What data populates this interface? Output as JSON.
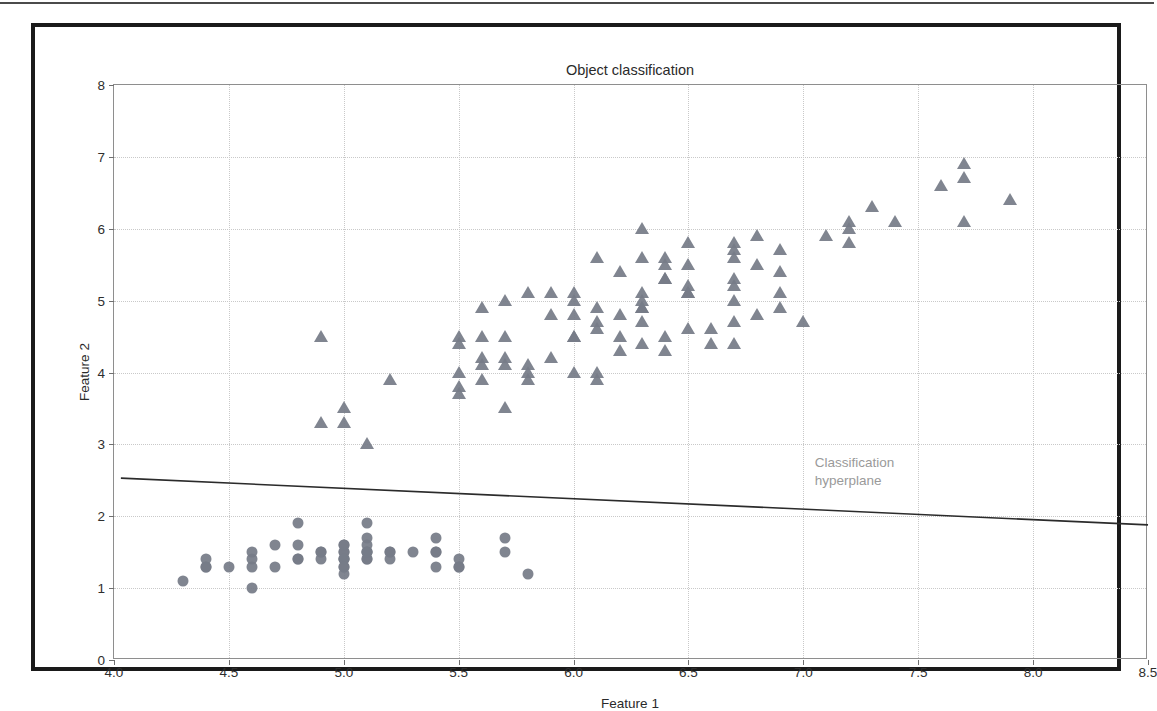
{
  "chart_data": {
    "type": "scatter",
    "title": "Object classification",
    "xlabel": "Feature 1",
    "ylabel": "Feature 2",
    "xlim": [
      4.0,
      8.5
    ],
    "ylim": [
      0,
      8
    ],
    "xticks": [
      "4.0",
      "4.5",
      "5.0",
      "5.5",
      "6.0",
      "6.5",
      "7.0",
      "7.5",
      "8.0",
      "8.5"
    ],
    "xtick_values": [
      4.0,
      4.5,
      5.0,
      5.5,
      6.0,
      6.5,
      7.0,
      7.5,
      8.0,
      8.5
    ],
    "yticks": [
      "0",
      "1",
      "2",
      "3",
      "4",
      "5",
      "6",
      "7",
      "8"
    ],
    "ytick_values": [
      0,
      1,
      2,
      3,
      4,
      5,
      6,
      7,
      8
    ],
    "grid": true,
    "grid_style": "dotted",
    "legend": "none",
    "marker_color": "#767c88",
    "line_color": "#2b2b2b",
    "annotation_color": "#9a9a9a",
    "annotations": [
      {
        "name": "hyperplane-label",
        "line1": "Classification",
        "line2": "hyperplane",
        "x": 7.05,
        "y": 2.62
      }
    ],
    "hyperplane": {
      "label": "Classification hyperplane",
      "x0": 4.03,
      "y0": 2.53,
      "x1": 8.5,
      "y1": 1.88
    },
    "series": [
      {
        "name": "class-a",
        "marker": "circle",
        "points": [
          [
            4.3,
            1.1
          ],
          [
            4.4,
            1.3
          ],
          [
            4.4,
            1.4
          ],
          [
            4.4,
            1.3
          ],
          [
            4.5,
            1.3
          ],
          [
            4.6,
            1.0
          ],
          [
            4.6,
            1.4
          ],
          [
            4.6,
            1.5
          ],
          [
            4.6,
            1.3
          ],
          [
            4.7,
            1.3
          ],
          [
            4.7,
            1.6
          ],
          [
            4.8,
            1.4
          ],
          [
            4.8,
            1.6
          ],
          [
            4.8,
            1.9
          ],
          [
            4.8,
            1.4
          ],
          [
            4.9,
            1.5
          ],
          [
            4.9,
            1.4
          ],
          [
            4.9,
            1.5
          ],
          [
            5.0,
            1.4
          ],
          [
            5.0,
            1.5
          ],
          [
            5.0,
            1.3
          ],
          [
            5.0,
            1.6
          ],
          [
            5.0,
            1.2
          ],
          [
            5.0,
            1.4
          ],
          [
            5.0,
            1.5
          ],
          [
            5.0,
            1.6
          ],
          [
            5.0,
            1.4
          ],
          [
            5.0,
            1.3
          ],
          [
            5.1,
            1.5
          ],
          [
            5.1,
            1.4
          ],
          [
            5.1,
            1.7
          ],
          [
            5.1,
            1.5
          ],
          [
            5.1,
            1.9
          ],
          [
            5.1,
            1.6
          ],
          [
            5.1,
            1.4
          ],
          [
            5.1,
            1.5
          ],
          [
            5.2,
            1.5
          ],
          [
            5.2,
            1.4
          ],
          [
            5.2,
            1.5
          ],
          [
            5.3,
            1.5
          ],
          [
            5.4,
            1.7
          ],
          [
            5.4,
            1.5
          ],
          [
            5.4,
            1.3
          ],
          [
            5.4,
            1.5
          ],
          [
            5.5,
            1.3
          ],
          [
            5.5,
            1.4
          ],
          [
            5.5,
            1.3
          ],
          [
            5.7,
            1.5
          ],
          [
            5.7,
            1.7
          ],
          [
            5.8,
            1.2
          ]
        ]
      },
      {
        "name": "class-b",
        "marker": "triangle",
        "points": [
          [
            4.9,
            4.5
          ],
          [
            4.9,
            3.3
          ],
          [
            5.0,
            3.5
          ],
          [
            5.0,
            3.3
          ],
          [
            5.1,
            3.0
          ],
          [
            5.2,
            3.9
          ],
          [
            5.5,
            4.5
          ],
          [
            5.5,
            4.4
          ],
          [
            5.5,
            4.0
          ],
          [
            5.5,
            3.8
          ],
          [
            5.5,
            3.7
          ],
          [
            5.6,
            4.5
          ],
          [
            5.6,
            4.2
          ],
          [
            5.6,
            4.1
          ],
          [
            5.6,
            3.9
          ],
          [
            5.6,
            4.9
          ],
          [
            5.7,
            4.5
          ],
          [
            5.7,
            4.2
          ],
          [
            5.7,
            4.1
          ],
          [
            5.7,
            3.5
          ],
          [
            5.7,
            5.0
          ],
          [
            5.8,
            5.1
          ],
          [
            5.8,
            4.0
          ],
          [
            5.8,
            4.1
          ],
          [
            5.8,
            3.9
          ],
          [
            5.9,
            4.8
          ],
          [
            5.9,
            4.2
          ],
          [
            5.9,
            5.1
          ],
          [
            6.0,
            5.1
          ],
          [
            6.0,
            4.5
          ],
          [
            6.0,
            4.0
          ],
          [
            6.0,
            4.8
          ],
          [
            6.0,
            5.0
          ],
          [
            6.0,
            4.5
          ],
          [
            6.1,
            4.7
          ],
          [
            6.1,
            4.0
          ],
          [
            6.1,
            4.6
          ],
          [
            6.1,
            5.6
          ],
          [
            6.1,
            4.9
          ],
          [
            6.1,
            3.9
          ],
          [
            6.2,
            4.3
          ],
          [
            6.2,
            4.5
          ],
          [
            6.2,
            4.8
          ],
          [
            6.2,
            5.4
          ],
          [
            6.3,
            4.7
          ],
          [
            6.3,
            4.9
          ],
          [
            6.3,
            5.6
          ],
          [
            6.3,
            4.4
          ],
          [
            6.3,
            5.1
          ],
          [
            6.3,
            6.0
          ],
          [
            6.3,
            4.9
          ],
          [
            6.3,
            5.0
          ],
          [
            6.4,
            4.5
          ],
          [
            6.4,
            5.3
          ],
          [
            6.4,
            4.3
          ],
          [
            6.4,
            5.5
          ],
          [
            6.4,
            5.6
          ],
          [
            6.4,
            5.3
          ],
          [
            6.5,
            4.6
          ],
          [
            6.5,
            5.1
          ],
          [
            6.5,
            5.2
          ],
          [
            6.5,
            5.5
          ],
          [
            6.5,
            5.8
          ],
          [
            6.5,
            5.1
          ],
          [
            6.6,
            4.4
          ],
          [
            6.6,
            4.6
          ],
          [
            6.7,
            5.0
          ],
          [
            6.7,
            4.7
          ],
          [
            6.7,
            5.7
          ],
          [
            6.7,
            5.2
          ],
          [
            6.7,
            5.6
          ],
          [
            6.7,
            5.8
          ],
          [
            6.7,
            4.4
          ],
          [
            6.7,
            5.3
          ],
          [
            6.8,
            4.8
          ],
          [
            6.8,
            5.5
          ],
          [
            6.8,
            5.9
          ],
          [
            6.9,
            4.9
          ],
          [
            6.9,
            5.1
          ],
          [
            6.9,
            5.4
          ],
          [
            6.9,
            5.7
          ],
          [
            7.0,
            4.7
          ],
          [
            7.1,
            5.9
          ],
          [
            7.2,
            6.0
          ],
          [
            7.2,
            5.8
          ],
          [
            7.2,
            6.1
          ],
          [
            7.3,
            6.3
          ],
          [
            7.4,
            6.1
          ],
          [
            7.6,
            6.6
          ],
          [
            7.7,
            6.7
          ],
          [
            7.7,
            6.9
          ],
          [
            7.7,
            6.1
          ],
          [
            7.9,
            6.4
          ]
        ]
      }
    ]
  }
}
